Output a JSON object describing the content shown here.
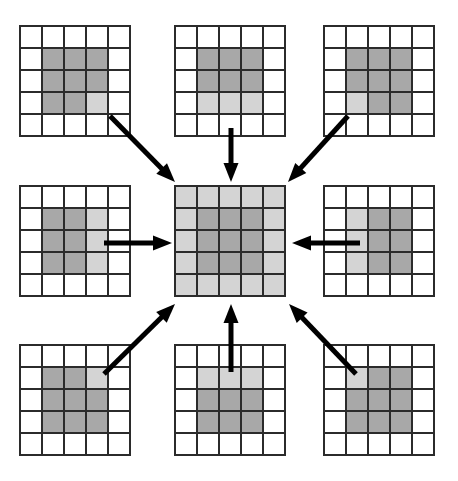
{
  "figure": {
    "type": "diagram",
    "canvas": {
      "width": 458,
      "height": 481
    },
    "colors": {
      "background": "#ffffff",
      "cell_empty": "#ffffff",
      "cell_light": "#d4d4d4",
      "cell_dark": "#a8a8a8",
      "grid_line": "#2b2b2b",
      "arrow": "#000000"
    },
    "grid_spec": {
      "rows": 5,
      "cols": 5,
      "cell_size": 22,
      "shade_legend": {
        "0": "empty",
        "1": "light",
        "2": "dark"
      }
    }
  },
  "grids": [
    {
      "name": "top-left-grid",
      "position": "top-left",
      "x": 20,
      "y": 26,
      "cells": [
        [
          0,
          0,
          0,
          0,
          0
        ],
        [
          0,
          2,
          2,
          2,
          0
        ],
        [
          0,
          2,
          2,
          2,
          0
        ],
        [
          0,
          2,
          2,
          1,
          0
        ],
        [
          0,
          0,
          0,
          0,
          0
        ]
      ]
    },
    {
      "name": "top-center-grid",
      "position": "top-center",
      "x": 175,
      "y": 26,
      "cells": [
        [
          0,
          0,
          0,
          0,
          0
        ],
        [
          0,
          2,
          2,
          2,
          0
        ],
        [
          0,
          2,
          2,
          2,
          0
        ],
        [
          0,
          1,
          1,
          1,
          0
        ],
        [
          0,
          0,
          0,
          0,
          0
        ]
      ]
    },
    {
      "name": "top-right-grid",
      "position": "top-right",
      "x": 324,
      "y": 26,
      "cells": [
        [
          0,
          0,
          0,
          0,
          0
        ],
        [
          0,
          2,
          2,
          2,
          0
        ],
        [
          0,
          2,
          2,
          2,
          0
        ],
        [
          0,
          1,
          2,
          2,
          0
        ],
        [
          0,
          0,
          0,
          0,
          0
        ]
      ]
    },
    {
      "name": "middle-left-grid",
      "position": "middle-left",
      "x": 20,
      "y": 186,
      "cells": [
        [
          0,
          0,
          0,
          0,
          0
        ],
        [
          0,
          2,
          2,
          1,
          0
        ],
        [
          0,
          2,
          2,
          1,
          0
        ],
        [
          0,
          2,
          2,
          1,
          0
        ],
        [
          0,
          0,
          0,
          0,
          0
        ]
      ]
    },
    {
      "name": "center-grid",
      "position": "center",
      "x": 175,
      "y": 186,
      "cells": [
        [
          1,
          1,
          1,
          1,
          1
        ],
        [
          1,
          2,
          2,
          2,
          1
        ],
        [
          1,
          2,
          2,
          2,
          1
        ],
        [
          1,
          2,
          2,
          2,
          1
        ],
        [
          1,
          1,
          1,
          1,
          1
        ]
      ]
    },
    {
      "name": "middle-right-grid",
      "position": "middle-right",
      "x": 324,
      "y": 186,
      "cells": [
        [
          0,
          0,
          0,
          0,
          0
        ],
        [
          0,
          1,
          2,
          2,
          0
        ],
        [
          0,
          1,
          2,
          2,
          0
        ],
        [
          0,
          1,
          2,
          2,
          0
        ],
        [
          0,
          0,
          0,
          0,
          0
        ]
      ]
    },
    {
      "name": "bottom-left-grid",
      "position": "bottom-left",
      "x": 20,
      "y": 345,
      "cells": [
        [
          0,
          0,
          0,
          0,
          0
        ],
        [
          0,
          2,
          2,
          1,
          0
        ],
        [
          0,
          2,
          2,
          2,
          0
        ],
        [
          0,
          2,
          2,
          2,
          0
        ],
        [
          0,
          0,
          0,
          0,
          0
        ]
      ]
    },
    {
      "name": "bottom-center-grid",
      "position": "bottom-center",
      "x": 175,
      "y": 345,
      "cells": [
        [
          0,
          0,
          0,
          0,
          0
        ],
        [
          0,
          1,
          1,
          1,
          0
        ],
        [
          0,
          2,
          2,
          2,
          0
        ],
        [
          0,
          2,
          2,
          2,
          0
        ],
        [
          0,
          0,
          0,
          0,
          0
        ]
      ]
    },
    {
      "name": "bottom-right-grid",
      "position": "bottom-right",
      "x": 324,
      "y": 345,
      "cells": [
        [
          0,
          0,
          0,
          0,
          0
        ],
        [
          0,
          1,
          2,
          2,
          0
        ],
        [
          0,
          2,
          2,
          2,
          0
        ],
        [
          0,
          2,
          2,
          2,
          0
        ],
        [
          0,
          0,
          0,
          0,
          0
        ]
      ]
    }
  ],
  "arrows": [
    {
      "name": "arrow-from-top-left",
      "from": "top-left-grid",
      "to": "center-grid",
      "x1": 110,
      "y1": 116,
      "x2": 175,
      "y2": 182
    },
    {
      "name": "arrow-from-top-center",
      "from": "top-center-grid",
      "to": "center-grid",
      "x1": 231,
      "y1": 128,
      "x2": 231,
      "y2": 182
    },
    {
      "name": "arrow-from-top-right",
      "from": "top-right-grid",
      "to": "center-grid",
      "x1": 348,
      "y1": 116,
      "x2": 288,
      "y2": 182
    },
    {
      "name": "arrow-from-middle-left",
      "from": "middle-left-grid",
      "to": "center-grid",
      "x1": 104,
      "y1": 243,
      "x2": 172,
      "y2": 243
    },
    {
      "name": "arrow-from-middle-right",
      "from": "middle-right-grid",
      "to": "center-grid",
      "x1": 360,
      "y1": 243,
      "x2": 292,
      "y2": 243
    },
    {
      "name": "arrow-from-bottom-left",
      "from": "bottom-left-grid",
      "to": "center-grid",
      "x1": 104,
      "y1": 374,
      "x2": 175,
      "y2": 304
    },
    {
      "name": "arrow-from-bottom-center",
      "from": "bottom-center-grid",
      "to": "center-grid",
      "x1": 231,
      "y1": 372,
      "x2": 231,
      "y2": 304
    },
    {
      "name": "arrow-from-bottom-right",
      "from": "bottom-right-grid",
      "to": "center-grid",
      "x1": 356,
      "y1": 374,
      "x2": 289,
      "y2": 304
    }
  ]
}
